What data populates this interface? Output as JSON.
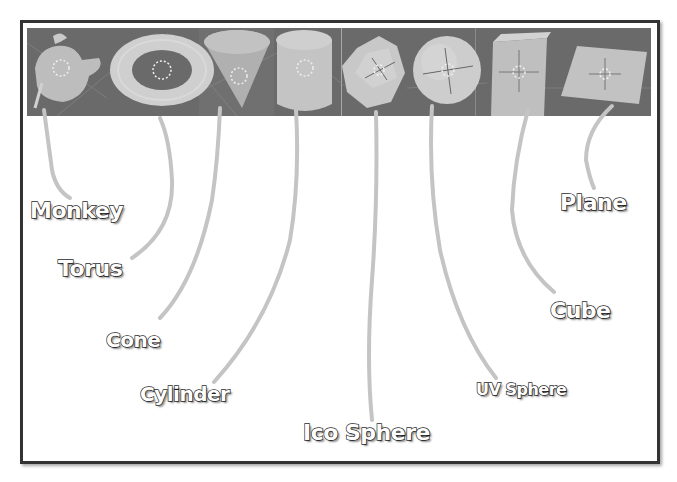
{
  "figure": {
    "strip_colors": {
      "background": "#6a6a6a",
      "object": "#c9c9c9",
      "divider": "#a8a8a8"
    },
    "frame_color": "#333333",
    "leader_color": "#c4c4c4"
  },
  "primitives": [
    {
      "id": "monkey",
      "label": "Monkey"
    },
    {
      "id": "torus",
      "label": "Torus"
    },
    {
      "id": "cone",
      "label": "Cone"
    },
    {
      "id": "cylinder",
      "label": "Cylinder"
    },
    {
      "id": "ico-sphere",
      "label": "Ico Sphere"
    },
    {
      "id": "uv-sphere",
      "label": "UV Sphere"
    },
    {
      "id": "cube",
      "label": "Cube"
    },
    {
      "id": "plane",
      "label": "Plane"
    }
  ]
}
